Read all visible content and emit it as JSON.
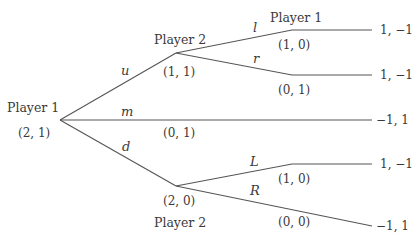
{
  "diagram": {
    "type": "extensive-form game tree",
    "nodes": [
      {
        "id": "root",
        "player": "Player 1",
        "pair": "(2, 1)"
      },
      {
        "id": "p2_upper",
        "player": "Player 2",
        "pair": "(1, 1)"
      },
      {
        "id": "p1_upper",
        "player": "Player 1",
        "pair": "(1, 0)"
      },
      {
        "id": "r_branch",
        "pair": "(0, 1)"
      },
      {
        "id": "m_branch",
        "pair": "(0, 1)"
      },
      {
        "id": "p2_lower",
        "player": "Player 2",
        "pair": "(2, 0)"
      },
      {
        "id": "L_branch",
        "pair": "(1, 0)"
      },
      {
        "id": "R_branch",
        "pair": "(0, 0)"
      }
    ],
    "actions": {
      "u": "u",
      "m": "m",
      "d": "d",
      "l": "l",
      "r": "r",
      "L": "L",
      "R": "R"
    },
    "payoffs": [
      "1, −1",
      "1, −1",
      "−1, 1",
      "1, −1",
      "−1, 1"
    ]
  }
}
